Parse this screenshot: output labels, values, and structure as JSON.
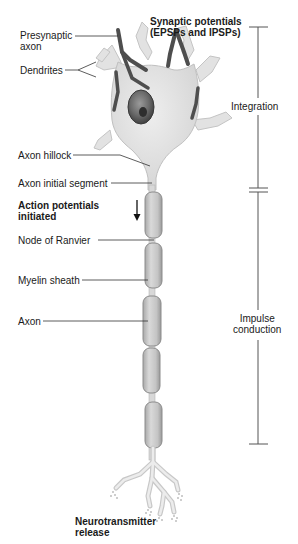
{
  "diagram": {
    "left_labels": [
      {
        "id": "presynaptic-axon",
        "text": "Presynaptic\naxon"
      },
      {
        "id": "dendrites",
        "text": "Dendrites"
      },
      {
        "id": "axon-hillock",
        "text": "Axon hillock"
      },
      {
        "id": "axon-initial-segment",
        "text": "Axon initial segment"
      },
      {
        "id": "action-potentials-initiated",
        "text": "Action potentials\ninitiated"
      },
      {
        "id": "node-of-ranvier",
        "text": "Node of Ranvier"
      },
      {
        "id": "myelin-sheath",
        "text": "Myelin sheath"
      },
      {
        "id": "axon",
        "text": "Axon"
      }
    ],
    "top_label": {
      "text": "Synaptic potentials\n(EPSPs and IPSPs)"
    },
    "bottom_label": {
      "text": "Neurotransmitter\nrelease"
    },
    "bracket_labels": [
      {
        "id": "integration",
        "text": "Integration"
      },
      {
        "id": "impulse-conduction",
        "text": "Impulse\nconduction"
      }
    ],
    "colors": {
      "cell_fill": "#e4e4e4",
      "cell_stroke": "#bdbdbd",
      "presynaptic": "#5a5a5a",
      "myelin_fill": "#c8c8c8",
      "myelin_stroke": "#8e8e8e",
      "leader_line": "#333333",
      "bracket": "#555555"
    }
  }
}
